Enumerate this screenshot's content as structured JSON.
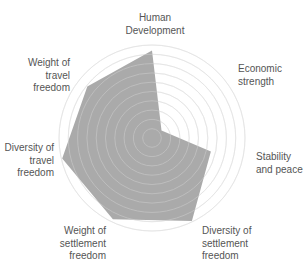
{
  "chart_data": {
    "type": "radar",
    "title": "",
    "categories": [
      "Human Development",
      "Economic strength",
      "Stability and peace",
      "Diversity of settlement freedom",
      "Weight of settlement freedom",
      "Diversity of travel freedom",
      "Weight of travel freedom"
    ],
    "series": [
      {
        "name": "Score",
        "values": [
          0.94,
          0.13,
          0.65,
          0.99,
          0.97,
          0.99,
          0.89
        ]
      }
    ],
    "rlim": [
      0,
      1
    ],
    "rings": 10,
    "grid": true,
    "legend": "none",
    "fill_color": "#a3a3a3",
    "ring_color": "#e6e6e6"
  },
  "labels": {
    "human_development": [
      "Human",
      "Development"
    ],
    "economic_strength": [
      "Economic",
      "strength"
    ],
    "stability_peace": [
      "Stability",
      "and peace"
    ],
    "diversity_settlement": [
      "Diversity of",
      "settlement",
      "freedom"
    ],
    "weight_settlement": [
      "Weight of",
      "settlement",
      "freedom"
    ],
    "diversity_travel": [
      "Diversity of",
      "travel",
      "freedom"
    ],
    "weight_travel": [
      "Weight of",
      "travel",
      "freedom"
    ]
  }
}
